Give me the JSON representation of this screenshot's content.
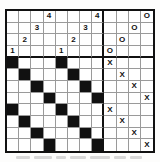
{
  "figure": {
    "name": "number-letter-grid-puzzle",
    "grid_rows": 12,
    "grid_cols": 12,
    "section_divider_col": 8,
    "section_divider_row": 4,
    "colors": {
      "ink": "#111111",
      "gridline": "#9a9a9a",
      "paper": "#ffffff",
      "filled": "#111111"
    }
  },
  "cells": [
    [
      {
        "t": ""
      },
      {
        "t": ""
      },
      {
        "t": ""
      },
      {
        "t": "4"
      },
      {
        "t": ""
      },
      {
        "t": ""
      },
      {
        "t": ""
      },
      {
        "t": "4"
      },
      {
        "t": ""
      },
      {
        "t": ""
      },
      {
        "t": ""
      },
      {
        "t": "O"
      }
    ],
    [
      {
        "t": ""
      },
      {
        "t": ""
      },
      {
        "t": "3"
      },
      {
        "t": ""
      },
      {
        "t": ""
      },
      {
        "t": ""
      },
      {
        "t": "3"
      },
      {
        "t": ""
      },
      {
        "t": ""
      },
      {
        "t": ""
      },
      {
        "t": "O"
      },
      {
        "t": ""
      }
    ],
    [
      {
        "t": ""
      },
      {
        "t": "2"
      },
      {
        "t": ""
      },
      {
        "t": ""
      },
      {
        "t": ""
      },
      {
        "t": "2"
      },
      {
        "t": ""
      },
      {
        "t": ""
      },
      {
        "t": ""
      },
      {
        "t": "O"
      },
      {
        "t": ""
      },
      {
        "t": ""
      }
    ],
    [
      {
        "t": "1"
      },
      {
        "t": ""
      },
      {
        "t": ""
      },
      {
        "t": ""
      },
      {
        "t": "1"
      },
      {
        "t": ""
      },
      {
        "t": ""
      },
      {
        "t": ""
      },
      {
        "t": "O"
      },
      {
        "t": ""
      },
      {
        "t": ""
      },
      {
        "t": ""
      }
    ],
    [
      {
        "t": "",
        "f": true
      },
      {
        "t": ""
      },
      {
        "t": ""
      },
      {
        "t": ""
      },
      {
        "t": "",
        "f": true
      },
      {
        "t": ""
      },
      {
        "t": ""
      },
      {
        "t": ""
      },
      {
        "t": "X"
      },
      {
        "t": ""
      },
      {
        "t": ""
      },
      {
        "t": ""
      }
    ],
    [
      {
        "t": ""
      },
      {
        "t": "",
        "f": true
      },
      {
        "t": ""
      },
      {
        "t": ""
      },
      {
        "t": ""
      },
      {
        "t": "",
        "f": true
      },
      {
        "t": ""
      },
      {
        "t": ""
      },
      {
        "t": ""
      },
      {
        "t": "X"
      },
      {
        "t": ""
      },
      {
        "t": ""
      }
    ],
    [
      {
        "t": ""
      },
      {
        "t": ""
      },
      {
        "t": "",
        "f": true
      },
      {
        "t": ""
      },
      {
        "t": ""
      },
      {
        "t": ""
      },
      {
        "t": "",
        "f": true
      },
      {
        "t": ""
      },
      {
        "t": ""
      },
      {
        "t": ""
      },
      {
        "t": "X"
      },
      {
        "t": ""
      }
    ],
    [
      {
        "t": ""
      },
      {
        "t": ""
      },
      {
        "t": ""
      },
      {
        "t": "",
        "f": true
      },
      {
        "t": ""
      },
      {
        "t": ""
      },
      {
        "t": ""
      },
      {
        "t": "",
        "f": true
      },
      {
        "t": ""
      },
      {
        "t": ""
      },
      {
        "t": ""
      },
      {
        "t": "X"
      }
    ],
    [
      {
        "t": "",
        "f": true
      },
      {
        "t": ""
      },
      {
        "t": ""
      },
      {
        "t": ""
      },
      {
        "t": "",
        "f": true
      },
      {
        "t": ""
      },
      {
        "t": ""
      },
      {
        "t": ""
      },
      {
        "t": "X"
      },
      {
        "t": ""
      },
      {
        "t": ""
      },
      {
        "t": ""
      }
    ],
    [
      {
        "t": ""
      },
      {
        "t": "",
        "f": true
      },
      {
        "t": ""
      },
      {
        "t": ""
      },
      {
        "t": ""
      },
      {
        "t": "",
        "f": true
      },
      {
        "t": ""
      },
      {
        "t": ""
      },
      {
        "t": ""
      },
      {
        "t": "X"
      },
      {
        "t": ""
      },
      {
        "t": ""
      }
    ],
    [
      {
        "t": ""
      },
      {
        "t": ""
      },
      {
        "t": "",
        "f": true
      },
      {
        "t": ""
      },
      {
        "t": ""
      },
      {
        "t": ""
      },
      {
        "t": "",
        "f": true
      },
      {
        "t": ""
      },
      {
        "t": ""
      },
      {
        "t": ""
      },
      {
        "t": "X"
      },
      {
        "t": ""
      }
    ],
    [
      {
        "t": ""
      },
      {
        "t": ""
      },
      {
        "t": ""
      },
      {
        "t": "",
        "f": true
      },
      {
        "t": ""
      },
      {
        "t": ""
      },
      {
        "t": ""
      },
      {
        "t": "",
        "f": true
      },
      {
        "t": ""
      },
      {
        "t": ""
      },
      {
        "t": ""
      },
      {
        "t": "X"
      }
    ]
  ],
  "caption": {
    "words": [
      {
        "left": 0,
        "width": 14
      },
      {
        "left": 18,
        "width": 18
      },
      {
        "left": 40,
        "width": 10
      },
      {
        "left": 54,
        "width": 16
      },
      {
        "left": 74,
        "width": 20
      },
      {
        "left": 98,
        "width": 12
      },
      {
        "left": 114,
        "width": 12
      }
    ]
  }
}
